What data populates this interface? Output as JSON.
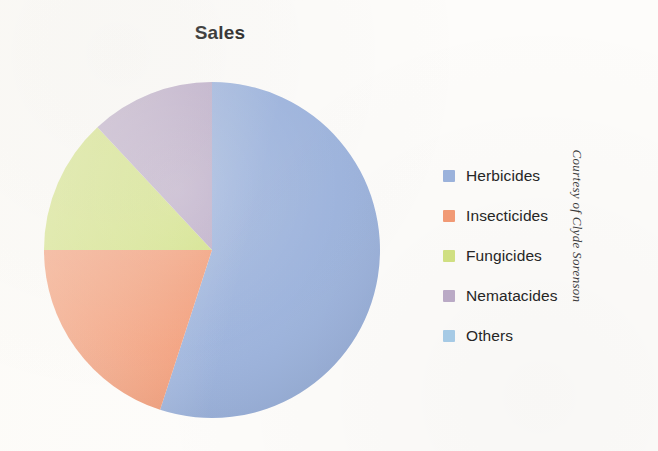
{
  "chart_data": {
    "type": "pie",
    "title": "Sales",
    "xlabel": "",
    "ylabel": "",
    "grid": false,
    "legend_position": "right",
    "start_angle_deg": 0,
    "direction": "clockwise",
    "categories": [
      "Herbicides",
      "Insecticides",
      "Fungicides",
      "Nematacides",
      "Others"
    ],
    "values": [
      55,
      20,
      13,
      12,
      0
    ],
    "unit": "percent",
    "colors": [
      "#9cb3dd",
      "#f39b76",
      "#d2e283",
      "#bcacc8",
      "#a8cde8"
    ],
    "slices": [
      {
        "label": "Herbicides",
        "value": 55,
        "color": "#9cb3dd",
        "start_deg": 0,
        "end_deg": 198
      },
      {
        "label": "Insecticides",
        "value": 20,
        "color": "#f39b76",
        "start_deg": 198,
        "end_deg": 270
      },
      {
        "label": "Fungicides",
        "value": 13,
        "color": "#d2e283",
        "start_deg": 270,
        "end_deg": 317
      },
      {
        "label": "Nematacides",
        "value": 12,
        "color": "#bcacc8",
        "start_deg": 317,
        "end_deg": 360
      },
      {
        "label": "Others",
        "value": 0,
        "color": "#a8cde8",
        "start_deg": 360,
        "end_deg": 360
      }
    ]
  },
  "legend": {
    "items": [
      {
        "label": "Herbicides",
        "color": "#9cb3dd"
      },
      {
        "label": "Insecticides",
        "color": "#f39b76"
      },
      {
        "label": "Fungicides",
        "color": "#d2e283"
      },
      {
        "label": "Nematacides",
        "color": "#bcacc8"
      },
      {
        "label": "Others",
        "color": "#a8cde8"
      }
    ]
  },
  "credit": {
    "text": "Courtesy of Clyde Sorenson"
  }
}
